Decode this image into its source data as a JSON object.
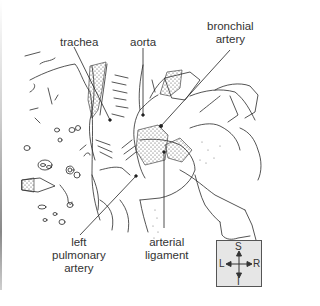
{
  "figure": {
    "type": "anatomical line drawing",
    "labels": {
      "trachea": "trachea",
      "aorta": "aorta",
      "bronchial_artery": [
        "bronchial",
        "artery"
      ],
      "left_pulmonary_artery": [
        "left",
        "pulmonary",
        "artery"
      ],
      "arterial_ligament": [
        "arterial",
        "ligament"
      ]
    },
    "orientation": {
      "superior": "S",
      "inferior": "I",
      "left": "L",
      "right": "R"
    },
    "colors": {
      "line": "#222222",
      "stipple": "#555555",
      "compass_bg": "#e6e6e6",
      "compass_border": "#555555"
    }
  }
}
